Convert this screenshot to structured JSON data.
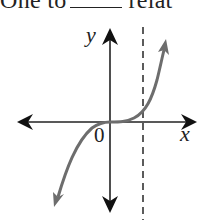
{
  "header": {
    "text_before": "One to",
    "text_after": "relat"
  },
  "graph": {
    "x_axis_label": "x",
    "y_axis_label": "y",
    "origin_label": "0",
    "colors": {
      "axes": "#222222",
      "curve": "#6d6d6d",
      "asymptote": "#333333",
      "background": "#ffffff"
    },
    "description": "Cubic-like curve through the origin, flat at the origin, with a vertical dashed line to the right of the y-axis"
  }
}
